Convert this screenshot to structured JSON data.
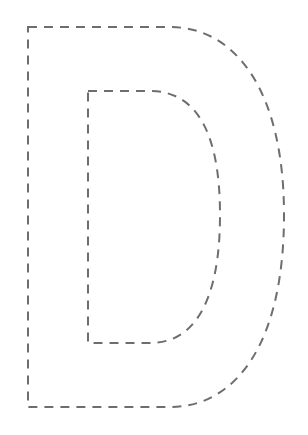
{
  "figure": {
    "letter": "D",
    "style": "dashed-outline",
    "stroke_color": "#6e6e6e",
    "background_color": "#ffffff",
    "stroke_width": 2,
    "dash_pattern": "9 7"
  }
}
